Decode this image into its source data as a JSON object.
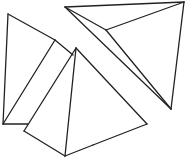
{
  "diagram": {
    "stroke_color": "#222222",
    "background": "#ffffff",
    "shapes": [
      {
        "name": "left-tetrahedron",
        "edges": [
          [
            8,
            14,
            55,
            40
          ],
          [
            55,
            40,
            73,
            55
          ],
          [
            8,
            14,
            3,
            124
          ],
          [
            3,
            124,
            28,
            124
          ],
          [
            55,
            40,
            3,
            124
          ]
        ]
      },
      {
        "name": "front-pyramid",
        "edges": [
          [
            76,
            48,
            24,
            131
          ],
          [
            24,
            131,
            65,
            156
          ],
          [
            76,
            48,
            65,
            156
          ],
          [
            76,
            48,
            147,
            124
          ],
          [
            147,
            124,
            93,
            145
          ],
          [
            65,
            156,
            93,
            145
          ]
        ]
      },
      {
        "name": "right-tetrahedron",
        "edges": [
          [
            65,
            7,
            184,
            2
          ],
          [
            184,
            2,
            171,
            109
          ],
          [
            65,
            7,
            171,
            109
          ],
          [
            184,
            2,
            106,
            30
          ],
          [
            106,
            30,
            171,
            109
          ],
          [
            65,
            7,
            106,
            30
          ]
        ]
      }
    ]
  }
}
